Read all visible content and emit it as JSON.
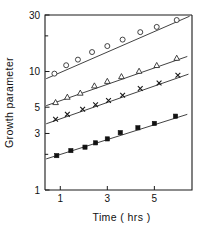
{
  "chart_data": {
    "type": "scatter",
    "title": "",
    "subtitle": "",
    "xlabel": "Time ( hrs )",
    "ylabel": "Growth  parameter",
    "xscale": "linear",
    "yscale": "log",
    "xlim": [
      0.35,
      6.6
    ],
    "ylim": [
      1,
      30
    ],
    "grid": false,
    "legend_position": "none",
    "x_ticks": [
      1,
      3,
      5
    ],
    "x_tick_labels": [
      "1",
      "3",
      "5"
    ],
    "y_ticks": [
      1,
      2,
      3,
      5,
      10,
      20,
      30
    ],
    "y_tick_labels_shown": [
      "1",
      "3",
      "5",
      "10",
      "30"
    ],
    "y_minor_ticks": [
      2,
      20
    ],
    "series": [
      {
        "name": "series-1-open-circle",
        "marker": "open-circle",
        "x": [
          0.75,
          1.25,
          1.75,
          2.35,
          3.0,
          3.65,
          4.4,
          5.1,
          5.95
        ],
        "y": [
          9.6,
          11.3,
          12.6,
          14.6,
          16.4,
          18.6,
          21.5,
          23.8,
          27.2
        ],
        "fit_line": {
          "x0": 0.4,
          "y0": 8.7,
          "x1": 6.5,
          "y1": 29.3
        }
      },
      {
        "name": "series-2-open-triangle",
        "marker": "open-triangle",
        "x": [
          0.8,
          1.3,
          1.85,
          2.45,
          3.0,
          3.6,
          4.35,
          5.1,
          5.95
        ],
        "y": [
          5.5,
          6.1,
          6.6,
          7.6,
          8.3,
          9.1,
          10.1,
          11.3,
          13.0
        ],
        "fit_line": {
          "x0": 0.4,
          "y0": 5.15,
          "x1": 6.4,
          "y1": 13.4
        }
      },
      {
        "name": "series-3-cross",
        "marker": "cross",
        "x": [
          0.8,
          1.3,
          1.95,
          2.5,
          3.05,
          3.65,
          4.4,
          5.2,
          6.0
        ],
        "y": [
          3.95,
          4.35,
          4.8,
          5.25,
          5.7,
          6.3,
          7.2,
          8.0,
          9.3
        ],
        "fit_line": {
          "x0": 0.4,
          "y0": 3.62,
          "x1": 6.45,
          "y1": 9.5
        }
      },
      {
        "name": "series-4-filled-square",
        "marker": "filled-square",
        "x": [
          0.85,
          1.45,
          2.05,
          2.5,
          3.0,
          3.55,
          4.3,
          5.0,
          5.9
        ],
        "y": [
          1.95,
          2.15,
          2.3,
          2.5,
          2.7,
          3.05,
          3.35,
          3.65,
          4.2
        ],
        "fit_line": {
          "x0": 0.4,
          "y0": 1.83,
          "x1": 6.4,
          "y1": 4.35
        }
      }
    ]
  },
  "axes": {
    "frame": {
      "left": 45,
      "right": 192,
      "top": 15,
      "bottom": 190
    }
  }
}
